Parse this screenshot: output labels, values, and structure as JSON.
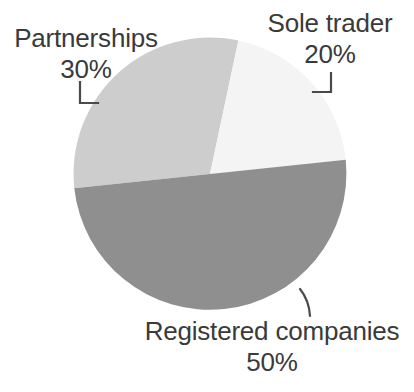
{
  "chart_data": {
    "type": "pie",
    "title": "",
    "xlabel": "",
    "ylabel": "",
    "categories": [
      "Sole trader",
      "Partnerships",
      "Registered companies"
    ],
    "values": [
      20,
      30,
      50
    ],
    "value_unit": "%",
    "legend_position": "none",
    "grid": false,
    "slices": [
      {
        "label": "Sole trader",
        "value": 20,
        "value_label": "20%",
        "color": "#f4f4f4",
        "start_angle_deg": 12,
        "end_angle_deg": 84
      },
      {
        "label": "Partnerships",
        "value": 30,
        "value_label": "30%",
        "color": "#cdcdcd",
        "start_angle_deg": 264,
        "end_angle_deg": 12
      },
      {
        "label": "Registered companies",
        "value": 50,
        "value_label": "50%",
        "color": "#8f8f8f",
        "start_angle_deg": 84,
        "end_angle_deg": 264
      }
    ]
  },
  "labels": {
    "partnerships": {
      "name": "Partnerships",
      "value": "30%"
    },
    "sole_trader": {
      "name": "Sole trader",
      "value": "20%"
    },
    "registered_companies": {
      "name": "Registered companies",
      "value": "50%"
    }
  },
  "colors": {
    "background": "#ffffff",
    "text": "#3a3a3a",
    "leader_line": "#4a4a4a",
    "slice_sole_trader": "#f4f4f4",
    "slice_partnerships": "#cdcdcd",
    "slice_registered_companies": "#8f8f8f"
  }
}
